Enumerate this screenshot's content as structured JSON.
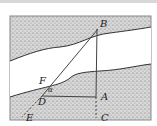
{
  "diagram": {
    "points": {
      "B": {
        "label": "B",
        "x": 98,
        "y": 29
      },
      "A": {
        "label": "A",
        "x": 96,
        "y": 97
      },
      "C": {
        "label": "C",
        "x": 96,
        "y": 118
      },
      "D": {
        "label": "D",
        "x": 42,
        "y": 96
      },
      "F": {
        "label": "F",
        "x": 47,
        "y": 86
      },
      "E": {
        "label": "E",
        "x": 22,
        "y": 117
      }
    },
    "angle_label": "α",
    "segments": [
      "B-E (through F, D; dashed below D)",
      "B-A (solid)",
      "A-C (dashed)",
      "D-A (solid)"
    ],
    "colors": {
      "line": "#444444",
      "land": "#bdbdbd",
      "water": "#ffffff",
      "frame": "#888888"
    }
  }
}
